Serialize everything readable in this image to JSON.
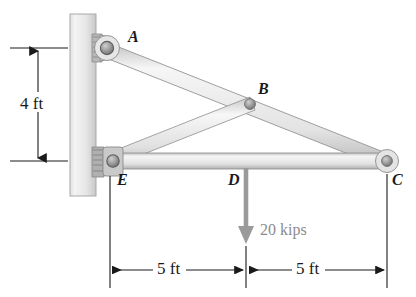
{
  "figure": {
    "background_color": "#ffffff"
  },
  "joints": [
    {
      "id": "A",
      "label": "A",
      "x": 107,
      "y": 48,
      "label_x": 128,
      "label_y": 30,
      "type": "pin-on-wall"
    },
    {
      "id": "B",
      "label": "B",
      "x": 250,
      "y": 104,
      "label_x": 258,
      "label_y": 82,
      "type": "pin"
    },
    {
      "id": "C",
      "label": "C",
      "x": 387,
      "y": 161,
      "label_x": 392,
      "label_y": 172,
      "type": "pin"
    },
    {
      "id": "D",
      "label": "D",
      "x": 246,
      "y": 161,
      "label_x": 228,
      "label_y": 172,
      "type": "load-point"
    },
    {
      "id": "E",
      "label": "E",
      "x": 110,
      "y": 161,
      "label_x": 117,
      "label_y": 172,
      "type": "pin-on-wall"
    }
  ],
  "members": [
    {
      "name": "member-A-C",
      "from": "A",
      "to": "C"
    },
    {
      "name": "member-E-C",
      "from": "E",
      "to": "C"
    },
    {
      "name": "member-E-B",
      "from": "E",
      "to": "B"
    }
  ],
  "wall": {
    "name": "wall",
    "x": 70,
    "y": 14,
    "width": 26,
    "height": 182,
    "fill_light": "#efefef",
    "fill_dark": "#d4d4d4"
  },
  "load": {
    "label": "20 kips",
    "magnitude": 20,
    "units": "kips",
    "applied_at": "D",
    "direction": "down",
    "color": "#9a9a9a",
    "label_x": 262,
    "label_y": 222,
    "arrow_top_y": 168,
    "arrow_tip_y": 243
  },
  "dimensions": [
    {
      "name": "vertical-dimension-4ft",
      "label": "4 ft",
      "value": 4,
      "units": "ft",
      "orientation": "vertical",
      "label_x": 20,
      "label_y": 96,
      "line_x": 38,
      "from_y": 48,
      "to_y": 161
    },
    {
      "name": "horizontal-dimension-5ft-left",
      "label": "5 ft",
      "value": 5,
      "units": "ft",
      "orientation": "horizontal",
      "label_x": 167,
      "label_y": 261,
      "line_y": 270,
      "from_x": 110,
      "to_x": 246
    },
    {
      "name": "horizontal-dimension-5ft-right",
      "label": "5 ft",
      "value": 5,
      "units": "ft",
      "orientation": "horizontal",
      "label_x": 306,
      "label_y": 261,
      "line_y": 270,
      "from_x": 246,
      "to_x": 387
    }
  ],
  "colors": {
    "member_fill_light": "#f2f2f2",
    "member_fill_mid": "#dedede",
    "member_fill_dark": "#c2c2c2",
    "member_outline": "#8f8f8f",
    "pin_fill": "#9e9e9e",
    "pin_outline": "#6e6e6e",
    "dimension_line": "#1a1a1a",
    "load_arrow": "#9a9a9a",
    "bracket_fill": "#b0b0b0"
  }
}
